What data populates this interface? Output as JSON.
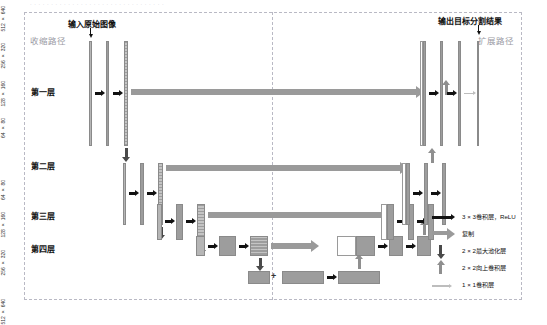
{
  "figure": {
    "top_caption_strip": "· · · · · · · · · · · · · · · · · · · · · · · · · · · · · · · ·",
    "input_label": "输入原始图像",
    "output_label": "输出目标分割结果",
    "contracting_path_label": "收缩路径",
    "expanding_path_label": "扩展路径"
  },
  "layers": [
    {
      "name": "第一层"
    },
    {
      "name": "第二层"
    },
    {
      "name": "第三层"
    },
    {
      "name": "第四层"
    }
  ],
  "legend": {
    "items": [
      {
        "icon": "black-arrow-icon",
        "label": "3 × 3卷积层，ReLU"
      },
      {
        "icon": "gray-arrow-icon",
        "label": "复制"
      },
      {
        "icon": "down-arrow-icon",
        "label": "2 × 2最大池化层"
      },
      {
        "icon": "up-arrow-icon",
        "label": "2 × 2向上卷积层"
      },
      {
        "icon": "thin-light-arrow-icon",
        "label": "1 × 1卷积层"
      }
    ]
  },
  "encoder": {
    "level1": {
      "dim": "512 × 640",
      "channels": [
        "3",
        "64",
        "64"
      ]
    },
    "level2": {
      "dim": "256 × 320",
      "channels": [
        "128",
        "128"
      ]
    },
    "level3": {
      "dim": "128 × 160",
      "channels": [
        "256",
        "256"
      ]
    },
    "level4": {
      "dim": "64 × 80",
      "channels": [
        "512",
        "512"
      ]
    },
    "bottleneck_dim": "32 × 40",
    "bottleneck_channels": [
      "1024",
      "1024"
    ]
  },
  "decoder": {
    "level4": {
      "channels": [
        "1024",
        "512",
        "512"
      ]
    },
    "level3": {
      "dim": "128 × 160",
      "channels": [
        "512",
        "256",
        "256"
      ]
    },
    "level2": {
      "dim": "256 × 320",
      "channels": [
        "256",
        "128",
        "128"
      ]
    },
    "level1": {
      "dim": "512 × 640",
      "channels": [
        "128",
        "64",
        "64",
        "2"
      ]
    }
  },
  "colors": {
    "block": "#9d9d9d",
    "block_light": "#b6b6b6",
    "concat_white": "#ffffff",
    "conv_arrow": "#111111",
    "copy_arrow": "#9a9a9a",
    "pool_arrow": "#4a4a4a",
    "upconv_arrow": "#8f8f8f",
    "final_conv_arrow": "#bdbdbd",
    "frame": "#b9b9c4"
  }
}
